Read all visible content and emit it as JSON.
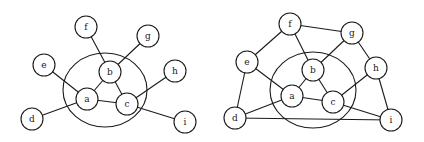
{
  "diagrams": [
    {
      "name": "graph-left",
      "node_radius": 11,
      "ellipse": {
        "cx": 105,
        "cy": 90,
        "rx": 42,
        "ry": 37
      },
      "nodes": [
        {
          "id": "f",
          "label": "f",
          "x": 86,
          "y": 27
        },
        {
          "id": "g",
          "label": "g",
          "x": 148,
          "y": 36
        },
        {
          "id": "e",
          "label": "e",
          "x": 44,
          "y": 65
        },
        {
          "id": "b",
          "label": "b",
          "x": 110,
          "y": 72
        },
        {
          "id": "h",
          "label": "h",
          "x": 175,
          "y": 71
        },
        {
          "id": "a",
          "label": "a",
          "x": 87,
          "y": 99
        },
        {
          "id": "c",
          "label": "c",
          "x": 127,
          "y": 104
        },
        {
          "id": "d",
          "label": "d",
          "x": 32,
          "y": 119
        },
        {
          "id": "i",
          "label": "i",
          "x": 185,
          "y": 122
        }
      ],
      "edges": [
        [
          "f",
          "b"
        ],
        [
          "g",
          "b"
        ],
        [
          "e",
          "a"
        ],
        [
          "d",
          "a"
        ],
        [
          "h",
          "c"
        ],
        [
          "c",
          "i"
        ],
        [
          "a",
          "b"
        ],
        [
          "a",
          "c"
        ],
        [
          "b",
          "c"
        ]
      ]
    },
    {
      "name": "graph-right",
      "node_radius": 11,
      "ellipse": {
        "cx": 313,
        "cy": 90,
        "rx": 43,
        "ry": 38
      },
      "nodes": [
        {
          "id": "f",
          "label": "f",
          "x": 290,
          "y": 24
        },
        {
          "id": "g",
          "label": "g",
          "x": 352,
          "y": 33
        },
        {
          "id": "e",
          "label": "e",
          "x": 247,
          "y": 62
        },
        {
          "id": "b",
          "label": "b",
          "x": 313,
          "y": 70
        },
        {
          "id": "h",
          "label": "h",
          "x": 376,
          "y": 68
        },
        {
          "id": "a",
          "label": "a",
          "x": 292,
          "y": 96
        },
        {
          "id": "c",
          "label": "c",
          "x": 333,
          "y": 102
        },
        {
          "id": "d",
          "label": "d",
          "x": 235,
          "y": 118
        },
        {
          "id": "i",
          "label": "i",
          "x": 391,
          "y": 120
        }
      ],
      "edges": [
        [
          "f",
          "g"
        ],
        [
          "f",
          "e"
        ],
        [
          "f",
          "b"
        ],
        [
          "g",
          "b"
        ],
        [
          "g",
          "h"
        ],
        [
          "e",
          "a"
        ],
        [
          "e",
          "d"
        ],
        [
          "d",
          "a"
        ],
        [
          "d",
          "i"
        ],
        [
          "h",
          "c"
        ],
        [
          "h",
          "i"
        ],
        [
          "c",
          "i"
        ],
        [
          "a",
          "b"
        ],
        [
          "a",
          "c"
        ],
        [
          "b",
          "c"
        ]
      ]
    }
  ]
}
